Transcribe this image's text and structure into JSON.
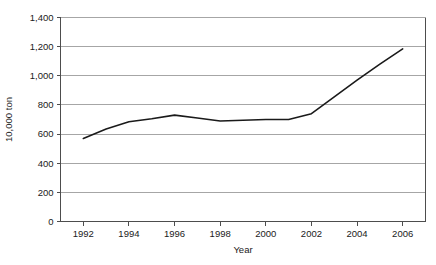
{
  "chart_data": {
    "type": "line",
    "title": "",
    "xlabel": "Year",
    "ylabel": "10,000 ton",
    "xlim": [
      1991,
      2007
    ],
    "ylim": [
      0,
      1400
    ],
    "ytick_step": 200,
    "xtick_step": 2,
    "grid": "horizontal",
    "legend": "none",
    "x": [
      1992,
      1993,
      1994,
      1995,
      1996,
      1997,
      1998,
      1999,
      2000,
      2001,
      2002,
      2003,
      2004,
      2005,
      2006
    ],
    "values": [
      570,
      635,
      685,
      705,
      730,
      710,
      690,
      695,
      700,
      700,
      740,
      855,
      970,
      1080,
      1185
    ],
    "xtick_labels": [
      "1992",
      "1994",
      "1996",
      "1998",
      "2000",
      "2002",
      "2004",
      "2006"
    ],
    "xtick_values": [
      1992,
      1994,
      1996,
      1998,
      2000,
      2002,
      2004,
      2006
    ],
    "ytick_labels": [
      "0",
      "200",
      "400",
      "600",
      "800",
      "1,000",
      "1,200",
      "1,400"
    ],
    "ytick_values": [
      0,
      200,
      400,
      600,
      800,
      1000,
      1200,
      1400
    ],
    "series_color": "#1a1a1a",
    "gridline_color": "#a6a6a6",
    "axis_color": "#4d4d4d",
    "background_color": "#ffffff"
  }
}
